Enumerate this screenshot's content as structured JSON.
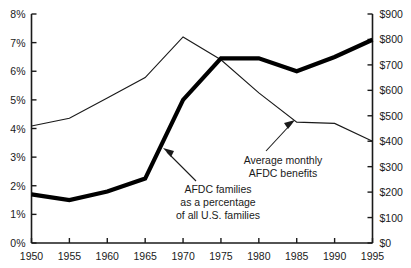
{
  "chart_data": {
    "type": "line",
    "title": "",
    "subtitle": "",
    "xlabel": "",
    "ylabel": "",
    "grid": false,
    "legend_position": "inline-annotations",
    "x": [
      1950,
      1955,
      1960,
      1965,
      1970,
      1975,
      1980,
      1985,
      1990,
      1995
    ],
    "x_tick_labels": [
      "1950",
      "1955",
      "1960",
      "1965",
      "1970",
      "1975",
      "1980",
      "1985",
      "1990",
      "1995"
    ],
    "xlim": [
      1950,
      1995
    ],
    "axes": {
      "left": {
        "label": "",
        "ylim": [
          0,
          8
        ],
        "tick_values": [
          0,
          1,
          2,
          3,
          4,
          5,
          6,
          7,
          8
        ],
        "tick_labels": [
          "0%",
          "1%",
          "2%",
          "3%",
          "4%",
          "5%",
          "6%",
          "7%",
          "8%"
        ],
        "unit": "percent"
      },
      "right": {
        "label": "",
        "ylim": [
          0,
          900
        ],
        "tick_values": [
          0,
          100,
          200,
          300,
          400,
          500,
          600,
          700,
          800,
          900
        ],
        "tick_labels": [
          "$0",
          "$100",
          "$200",
          "$300",
          "$400",
          "$500",
          "$600",
          "$700",
          "$800",
          "$900"
        ],
        "unit": "dollars"
      }
    },
    "series": [
      {
        "name": "AFDC families as a percentage of all U.S. families",
        "axis": "left",
        "style": "thick",
        "unit": "percent",
        "values": [
          1.7,
          1.5,
          1.8,
          2.25,
          5.0,
          6.45,
          6.45,
          6.0,
          6.5,
          7.1
        ]
      },
      {
        "name": "Average monthly AFDC benefits",
        "axis": "right",
        "style": "thin",
        "unit": "dollars",
        "values": [
          460,
          490,
          570,
          650,
          810,
          720,
          590,
          475,
          470,
          400
        ]
      }
    ],
    "annotations": [
      {
        "id": "afdc-families-annotation",
        "lines": [
          "AFDC families",
          "as a percentage",
          "of all U.S. families"
        ],
        "points_to_series": "AFDC families as a percentage of all U.S. families"
      },
      {
        "id": "avg-benefits-annotation",
        "lines": [
          "Average monthly",
          "AFDC benefits"
        ],
        "points_to_series": "Average monthly AFDC benefits"
      }
    ],
    "colors": {
      "background": "#ffffff",
      "ink": "#1a1a1a",
      "thick_series": "#000000",
      "thin_series": "#1a1a1a"
    }
  }
}
